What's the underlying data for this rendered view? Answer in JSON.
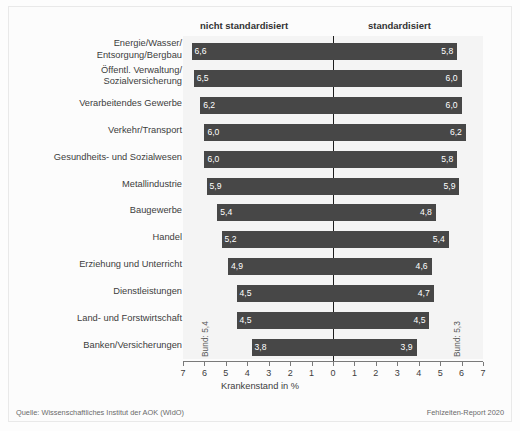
{
  "header": {
    "left_label": "nicht standardisiert",
    "right_label": "standardisiert"
  },
  "annotations": {
    "bund_left": "Bund: 5,4",
    "bund_right": "Bund: 5,3"
  },
  "footer": {
    "source": "Quelle: Wissenschaftliches Institut der AOK (WIdO)",
    "report": "Fehlzeiten-Report 2020"
  },
  "colors": {
    "bar": "#474747",
    "band": "#f4f4f4",
    "axis": "#7a7a7a",
    "zero_line": "#1d1d1d",
    "text": "#3d3d3d"
  },
  "chart_data": {
    "type": "bar",
    "orientation": "horizontal-diverging",
    "title": "",
    "xlabel": "Krankenstand in %",
    "ylabel": "",
    "xlim": [
      -7,
      7
    ],
    "xticks": [
      7,
      6,
      5,
      4,
      3,
      2,
      1,
      0,
      1,
      2,
      3,
      4,
      5,
      6,
      7
    ],
    "xtick_labels": [
      "7",
      "6",
      "5",
      "4",
      "3",
      "2",
      "1",
      "0",
      "1",
      "2",
      "3",
      "4",
      "5",
      "6",
      "7"
    ],
    "grid": false,
    "legend": [
      "nicht standardisiert",
      "standardisiert"
    ],
    "legend_position": "top",
    "categories": [
      "Energie/Wasser/\nEntsorgung/Bergbau",
      "Öffentl. Verwaltung/\nSozialversicherung",
      "Verarbeitendes Gewerbe",
      "Verkehr/Transport",
      "Gesundheits- und Sozialwesen",
      "Metallindustrie",
      "Baugewerbe",
      "Handel",
      "Erziehung und Unterricht",
      "Dienstleistungen",
      "Land- und Forstwirtschaft",
      "Banken/Versicherungen"
    ],
    "series": [
      {
        "name": "nicht standardisiert",
        "side": "left",
        "values": [
          6.6,
          6.5,
          6.2,
          6.0,
          6.0,
          5.9,
          5.4,
          5.2,
          4.9,
          4.5,
          4.5,
          3.8
        ],
        "labels": [
          "6,6",
          "6,5",
          "6,2",
          "6,0",
          "6,0",
          "5,9",
          "5,4",
          "5,2",
          "4,9",
          "4,5",
          "4,5",
          "3,8"
        ]
      },
      {
        "name": "standardisiert",
        "side": "right",
        "values": [
          5.8,
          6.0,
          6.0,
          6.2,
          5.8,
          5.9,
          4.8,
          5.4,
          4.6,
          4.7,
          4.5,
          3.9
        ],
        "labels": [
          "5,8",
          "6,0",
          "6,0",
          "6,2",
          "5,8",
          "5,9",
          "4,8",
          "5,4",
          "4,6",
          "4,7",
          "4,5",
          "3,9"
        ]
      }
    ],
    "national_average": {
      "nicht standardisiert": 5.4,
      "standardisiert": 5.3
    }
  }
}
